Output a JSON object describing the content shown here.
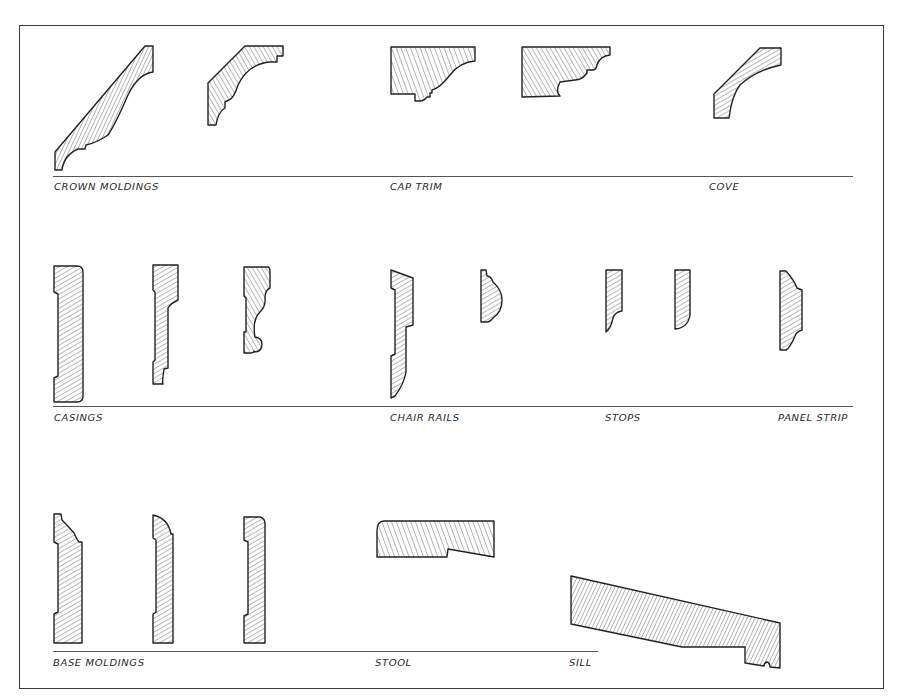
{
  "drawing": {
    "title": "Molding profiles reference sheet",
    "rows": [
      {
        "groups": [
          {
            "label": "CROWN MOLDINGS",
            "profile_count": 2
          },
          {
            "label": "CAP TRIM",
            "profile_count": 2
          },
          {
            "label": "COVE",
            "profile_count": 1
          }
        ]
      },
      {
        "groups": [
          {
            "label": "CASINGS",
            "profile_count": 3
          },
          {
            "label": "CHAIR RAILS",
            "profile_count": 2
          },
          {
            "label": "STOPS",
            "profile_count": 2
          },
          {
            "label": "PANEL STRIP",
            "profile_count": 1
          }
        ]
      },
      {
        "groups": [
          {
            "label": "BASE MOLDINGS",
            "profile_count": 3
          },
          {
            "label": "STOOL",
            "profile_count": 1
          },
          {
            "label": "SILL",
            "profile_count": 1
          }
        ]
      }
    ],
    "colors": {
      "ink": "#2a2a2a",
      "paper": "#ffffff",
      "rule": "#555555"
    }
  }
}
